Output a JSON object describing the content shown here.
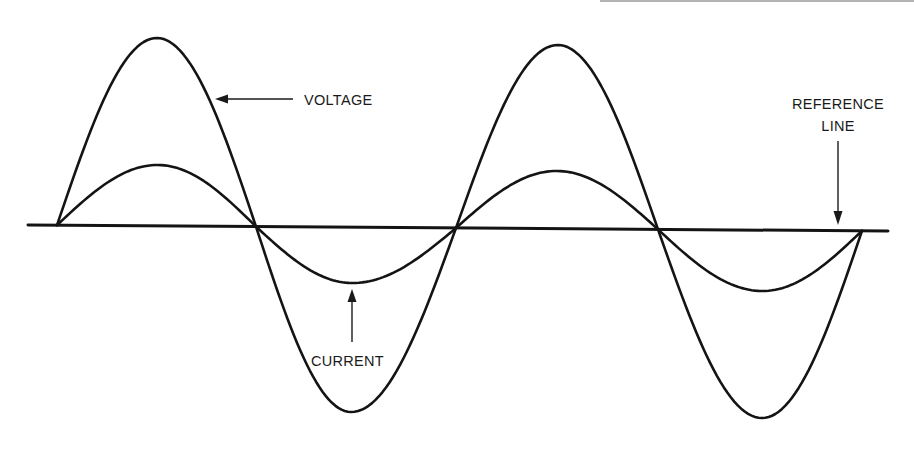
{
  "figure": {
    "type": "ac-waveform-in-phase",
    "labels": {
      "voltage": "VOLTAGE",
      "current": "CURRENT",
      "reference_line_1": "REFERENCE",
      "reference_line_2": "LINE"
    },
    "colors": {
      "ink": "#141414",
      "background": "#ffffff"
    },
    "reference_line": {
      "x1": 28,
      "y1": 225,
      "x2": 888,
      "y2": 231
    },
    "zero_crossings_x": [
      57,
      256,
      456,
      658,
      862
    ],
    "voltage": {
      "description": "larger amplitude sine wave, two full cycles",
      "extrema": [
        {
          "x": 157,
          "y": 38,
          "kind": "peak"
        },
        {
          "x": 351,
          "y": 412,
          "kind": "trough"
        },
        {
          "x": 558,
          "y": 45,
          "kind": "peak"
        },
        {
          "x": 762,
          "y": 418,
          "kind": "trough"
        }
      ]
    },
    "current": {
      "description": "smaller amplitude sine wave in phase with voltage",
      "extrema": [
        {
          "x": 158,
          "y": 165,
          "kind": "peak"
        },
        {
          "x": 352,
          "y": 283,
          "kind": "trough"
        },
        {
          "x": 557,
          "y": 171,
          "kind": "peak"
        },
        {
          "x": 762,
          "y": 291,
          "kind": "trough"
        }
      ]
    },
    "annotations": [
      {
        "label_key": "voltage",
        "arrow_from": [
          293,
          99
        ],
        "arrow_to": [
          215,
          99
        ],
        "text_pos": [
          304,
          105
        ]
      },
      {
        "label_key": "current",
        "arrow_from": [
          352,
          342
        ],
        "arrow_to": [
          352,
          289
        ],
        "text_pos": [
          311,
          366
        ]
      },
      {
        "label_key": "reference_line",
        "arrow_from": [
          838,
          140
        ],
        "arrow_to": [
          838,
          225
        ],
        "text_pos": [
          838,
          109
        ]
      }
    ]
  }
}
